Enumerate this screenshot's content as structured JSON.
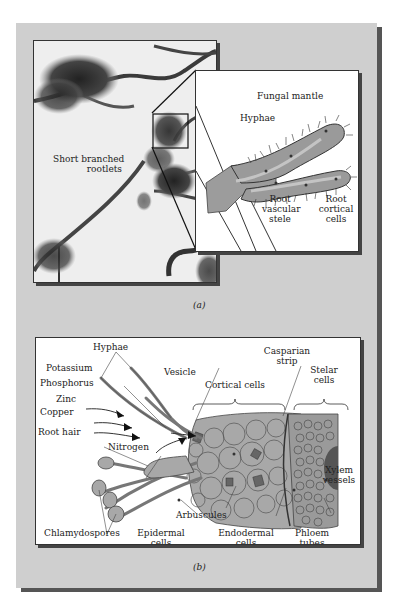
{
  "figure": {
    "panel_a": {
      "caption": "(a)",
      "photo_label": [
        "Short branched",
        "rootlets"
      ],
      "inset_labels": {
        "fungal_mantle": "Fungal mantle",
        "hyphae": "Hyphae",
        "root_vascular_stele": [
          "Root",
          "vascular",
          "stele"
        ],
        "root_cortical_cells": [
          "Root",
          "cortical",
          "cells"
        ]
      }
    },
    "panel_b": {
      "caption": "(b)",
      "labels": {
        "hyphae": "Hyphae",
        "potassium": "Potassium",
        "phosphorus": "Phosphorus",
        "zinc": "Zinc",
        "copper": "Copper",
        "root_hair": "Root hair",
        "nitrogen": "Nitrogen",
        "chlamydospores": "Chlamydospores",
        "vesicle": "Vesicle",
        "cortical_cells": "Cortical cells",
        "casparian_strip": [
          "Casparian",
          "strip"
        ],
        "stelar_cells": [
          "Stelar",
          "cells"
        ],
        "xylem_vessels": [
          "Xylem",
          "vessels"
        ],
        "arbuscules": "Arbuscules",
        "epidermal_cells": [
          "Epidermal",
          "cells"
        ],
        "endodermal_cells": [
          "Endodermal",
          "cells"
        ],
        "phloem_tubes": [
          "Phloem",
          "tubes"
        ]
      }
    },
    "colors": {
      "panel_bg": "#cfcfcf",
      "tissue_fill": "#a8a8a8",
      "stele_fill": "#8c8c8c",
      "outline": "#333333"
    }
  }
}
